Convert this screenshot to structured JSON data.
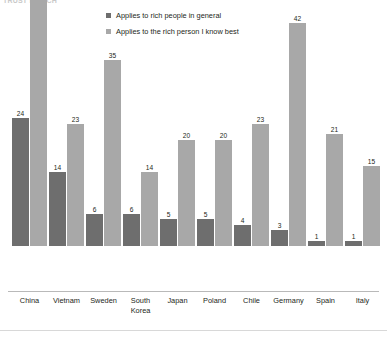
{
  "title_fragment": "TRUST  IN  RICH",
  "legend": {
    "position": "top-center",
    "items": [
      {
        "label": "Applies to rich people in general",
        "color": "#6e6e6e",
        "swatch_name": "legend-swatch-general"
      },
      {
        "label": "Applies to the rich person I know best",
        "color": "#a8a8a8",
        "swatch_name": "legend-swatch-known"
      }
    ]
  },
  "colors": {
    "series_general": "#6e6e6e",
    "series_known_best": "#a8a8a8",
    "text": "#231f20",
    "baseline": "#b9b9b9",
    "rule": "#d8d8d8",
    "background": "#ffffff"
  },
  "chart_data": {
    "type": "bar",
    "title": "",
    "subtitle": "",
    "xlabel": "",
    "ylabel": "",
    "ylim": [
      0,
      47
    ],
    "grid": false,
    "legend_position": "top-center",
    "grouping": "grouped",
    "categories": [
      "China",
      "Vietnam",
      "Sweden",
      "South Korea",
      "Japan",
      "Poland",
      "Chile",
      "Germany",
      "Spain",
      "Italy"
    ],
    "category_lines": [
      [
        "China"
      ],
      [
        "Vietnam"
      ],
      [
        "Sweden"
      ],
      [
        "South",
        "Korea"
      ],
      [
        "Japan"
      ],
      [
        "Poland"
      ],
      [
        "Chile"
      ],
      [
        "Germany"
      ],
      [
        "Spain"
      ],
      [
        "Italy"
      ]
    ],
    "series": [
      {
        "name": "Applies to rich people in general",
        "color": "#6e6e6e",
        "values": [
          24,
          14,
          6,
          6,
          5,
          5,
          4,
          3,
          1,
          1
        ]
      },
      {
        "name": "Applies to the rich person I know best",
        "color": "#a8a8a8",
        "values": [
          47,
          23,
          35,
          14,
          20,
          20,
          23,
          42,
          21,
          15
        ]
      }
    ]
  },
  "layout": {
    "baseline_y": 291,
    "max_bar_height": 250,
    "group_start_x": 12,
    "group_pitch": 37,
    "bar_width": 17
  }
}
